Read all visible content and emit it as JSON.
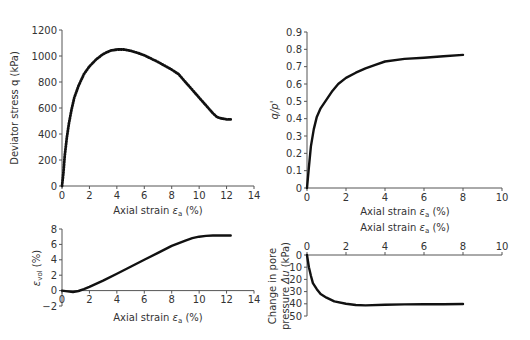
{
  "chart_data": [
    {
      "id": "q_vs_strain",
      "type": "line",
      "title": "",
      "xlabel": "Axial strain εa (%)",
      "ylabel": "Deviator stress q (kPa)",
      "xlim": [
        0,
        14
      ],
      "ylim": [
        0,
        1200
      ],
      "xticks": [
        0,
        2,
        4,
        6,
        8,
        10,
        12,
        14
      ],
      "yticks": [
        0,
        200,
        400,
        600,
        800,
        1000,
        1200
      ],
      "grid": false,
      "series": [
        {
          "name": "q",
          "x": [
            0,
            0.1,
            0.2,
            0.35,
            0.5,
            0.7,
            0.9,
            1.2,
            1.6,
            2.0,
            2.5,
            3.0,
            3.5,
            4.0,
            4.5,
            5.0,
            5.5,
            6.0,
            6.5,
            7.0,
            7.5,
            8.0,
            8.5,
            9.0,
            9.5,
            10.0,
            10.5,
            11.0,
            11.3,
            11.6,
            12.0,
            12.3
          ],
          "y": [
            0,
            100,
            230,
            370,
            480,
            590,
            680,
            770,
            860,
            920,
            975,
            1015,
            1040,
            1050,
            1050,
            1040,
            1025,
            1005,
            980,
            955,
            925,
            895,
            860,
            800,
            740,
            680,
            620,
            560,
            530,
            520,
            512,
            512
          ]
        }
      ]
    },
    {
      "id": "stress_ratio_vs_strain",
      "type": "line",
      "title": "",
      "xlabel": "Axial strain εa (%)",
      "ylabel": "q/p'",
      "xlim": [
        0,
        10
      ],
      "ylim": [
        0,
        0.9
      ],
      "xticks": [
        0,
        2,
        4,
        6,
        8,
        10
      ],
      "yticks": [
        0,
        0.1,
        0.2,
        0.3,
        0.4,
        0.5,
        0.6,
        0.7,
        0.8,
        0.9
      ],
      "grid": false,
      "series": [
        {
          "name": "q/p'",
          "x": [
            0,
            0.1,
            0.2,
            0.35,
            0.5,
            0.7,
            1.0,
            1.3,
            1.6,
            2.0,
            2.5,
            3.0,
            3.5,
            4.0,
            5.0,
            6.0,
            7.0,
            8.0
          ],
          "y": [
            0,
            0.12,
            0.24,
            0.34,
            0.41,
            0.46,
            0.51,
            0.56,
            0.6,
            0.635,
            0.665,
            0.69,
            0.71,
            0.73,
            0.745,
            0.752,
            0.76,
            0.768
          ]
        }
      ]
    },
    {
      "id": "volumetric_strain_vs_strain",
      "type": "line",
      "title": "",
      "xlabel": "Axial strain εa (%)",
      "ylabel": "εvol (%)",
      "xlim": [
        0,
        14
      ],
      "ylim": [
        -2,
        8
      ],
      "xticks": [
        0,
        2,
        4,
        6,
        8,
        10,
        12,
        14
      ],
      "yticks": [
        -2,
        0,
        2,
        4,
        6,
        8
      ],
      "grid": false,
      "series": [
        {
          "name": "εvol",
          "x": [
            0,
            0.4,
            0.8,
            1.2,
            1.6,
            2.0,
            3.0,
            4.0,
            5.0,
            6.0,
            7.0,
            8.0,
            9.0,
            9.5,
            10.0,
            10.5,
            11.0,
            11.5,
            12.3
          ],
          "y": [
            0,
            -0.1,
            -0.2,
            -0.05,
            0.2,
            0.5,
            1.3,
            2.2,
            3.1,
            4.0,
            4.9,
            5.8,
            6.5,
            6.8,
            7.0,
            7.1,
            7.15,
            7.15,
            7.15
          ]
        }
      ]
    },
    {
      "id": "pore_pressure_vs_strain",
      "type": "line",
      "title": "",
      "xlabel": "Axial strain εa (%)",
      "ylabel": "Change in pore pressure Δu (kPa)",
      "xlim": [
        0,
        10
      ],
      "ylim": [
        0,
        50
      ],
      "y_inverted": true,
      "x_axis_position": "top",
      "xticks": [
        0,
        2,
        4,
        6,
        8,
        10
      ],
      "yticks": [
        0,
        10,
        20,
        30,
        40,
        50
      ],
      "grid": false,
      "series": [
        {
          "name": "Δu",
          "x": [
            0,
            0.1,
            0.2,
            0.3,
            0.5,
            0.7,
            1.0,
            1.4,
            2.0,
            2.5,
            3.0,
            4.0,
            5.0,
            6.0,
            7.0,
            8.0
          ],
          "y": [
            0,
            10,
            17,
            23,
            28,
            32,
            35,
            38,
            40,
            41,
            41.3,
            40.8,
            40.5,
            40.4,
            40.3,
            40.2
          ]
        }
      ]
    }
  ],
  "labels": {
    "top_left_y": "Deviator stress q (kPa)",
    "top_right_y": "q/p'",
    "bottom_left_y": "εvol (%)",
    "bottom_right_y_line1": "Change in pore",
    "bottom_right_y_line2": "pressure Δu (kPa)",
    "x_axis": "Axial strain εa (%)"
  }
}
